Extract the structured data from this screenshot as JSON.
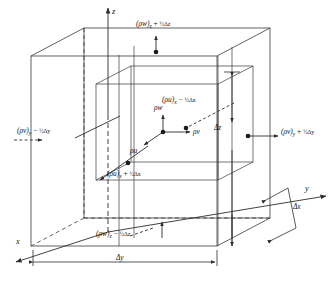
{
  "figure": {
    "type": "3d-control-volume-diagram"
  },
  "axes": {
    "z": "z",
    "y": "y",
    "x": "x"
  },
  "dimensions": {
    "dz": "Δz",
    "dy": "Δy",
    "dx": "Δx"
  },
  "center_fluxes": {
    "rho_w": "ρw",
    "rho_v": "ρv",
    "rho_u": "ρu"
  },
  "face_fluxes": {
    "top": {
      "base": "(ρw)",
      "sub": "z",
      "op": " + ",
      "delta": "½Δz",
      "full": "(ρw)z + ½Δz"
    },
    "bottom": {
      "base": "(ρw)",
      "sub": "z",
      "op": " − ",
      "delta": "½Δz",
      "full": "(ρw)z − ½Δz"
    },
    "left": {
      "base": "(ρv)",
      "sub": "y",
      "op": " − ",
      "delta": "½Δy",
      "full": "(ρv)y − ½Δy"
    },
    "right": {
      "base": "(ρv)",
      "sub": "y",
      "op": " + ",
      "delta": "½Δy",
      "full": "(ρv)y + ½Δy"
    },
    "back": {
      "base": "(ρu)",
      "sub": "x",
      "op": " − ",
      "delta": "½Δx",
      "full": "(ρu)x − ½Δx"
    },
    "front": {
      "base": "(ρu)",
      "sub": "x",
      "op": " + ",
      "delta": "½Δx",
      "full": "(ρu)x + ½Δx"
    }
  },
  "colors": {
    "line": "#3a3a3a",
    "text": "#111111",
    "background": "#ffffff"
  }
}
